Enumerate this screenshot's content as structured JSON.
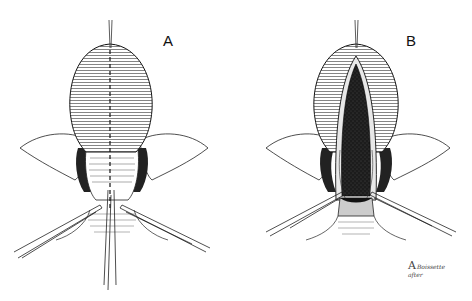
{
  "figure": {
    "panels": [
      {
        "id": "A",
        "label": "A",
        "description": "Closed organ with dashed midline incision guide, traction suture at apex, forceps retracting at base"
      },
      {
        "id": "B",
        "label": "B",
        "description": "Organ opened along midline revealing dark stippled lumen, forceps retracting opened edges"
      }
    ],
    "signature": {
      "mark": "A",
      "name": "Boissette",
      "subtitle": "after"
    },
    "colors": {
      "line": "#1a1a1a",
      "background": "#ffffff",
      "lumen": "#1c1c1c"
    }
  }
}
